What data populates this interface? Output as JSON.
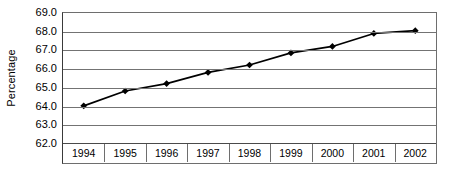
{
  "chart_data": {
    "type": "line",
    "title": "",
    "xlabel": "",
    "ylabel": "Percentage",
    "categories": [
      "1994",
      "1995",
      "1996",
      "1997",
      "1998",
      "1999",
      "2000",
      "2001",
      "2002"
    ],
    "values": [
      64.0,
      64.8,
      65.2,
      65.8,
      66.2,
      66.85,
      67.2,
      67.9,
      68.05
    ],
    "series": [
      {
        "name": "Percentage",
        "values": [
          64.0,
          64.8,
          65.2,
          65.8,
          66.2,
          66.85,
          67.2,
          67.9,
          68.05
        ]
      }
    ],
    "ylim": [
      62.0,
      69.0
    ],
    "ytick_step": 1.0,
    "ytick_labels": [
      "69.0",
      "68.0",
      "67.0",
      "66.0",
      "65.0",
      "64.0",
      "63.0",
      "62.0"
    ],
    "ytick_values": [
      69.0,
      68.0,
      67.0,
      66.0,
      65.0,
      64.0,
      63.0,
      62.0
    ],
    "grid": true,
    "grid_axis": "y",
    "legend": false,
    "legend_position": "none",
    "marker": "diamond",
    "marker_color": "#000000",
    "line_color": "#000000",
    "grid_color": "#737373",
    "axis_color": "#3a3a3a",
    "background_color": "#ffffff"
  }
}
